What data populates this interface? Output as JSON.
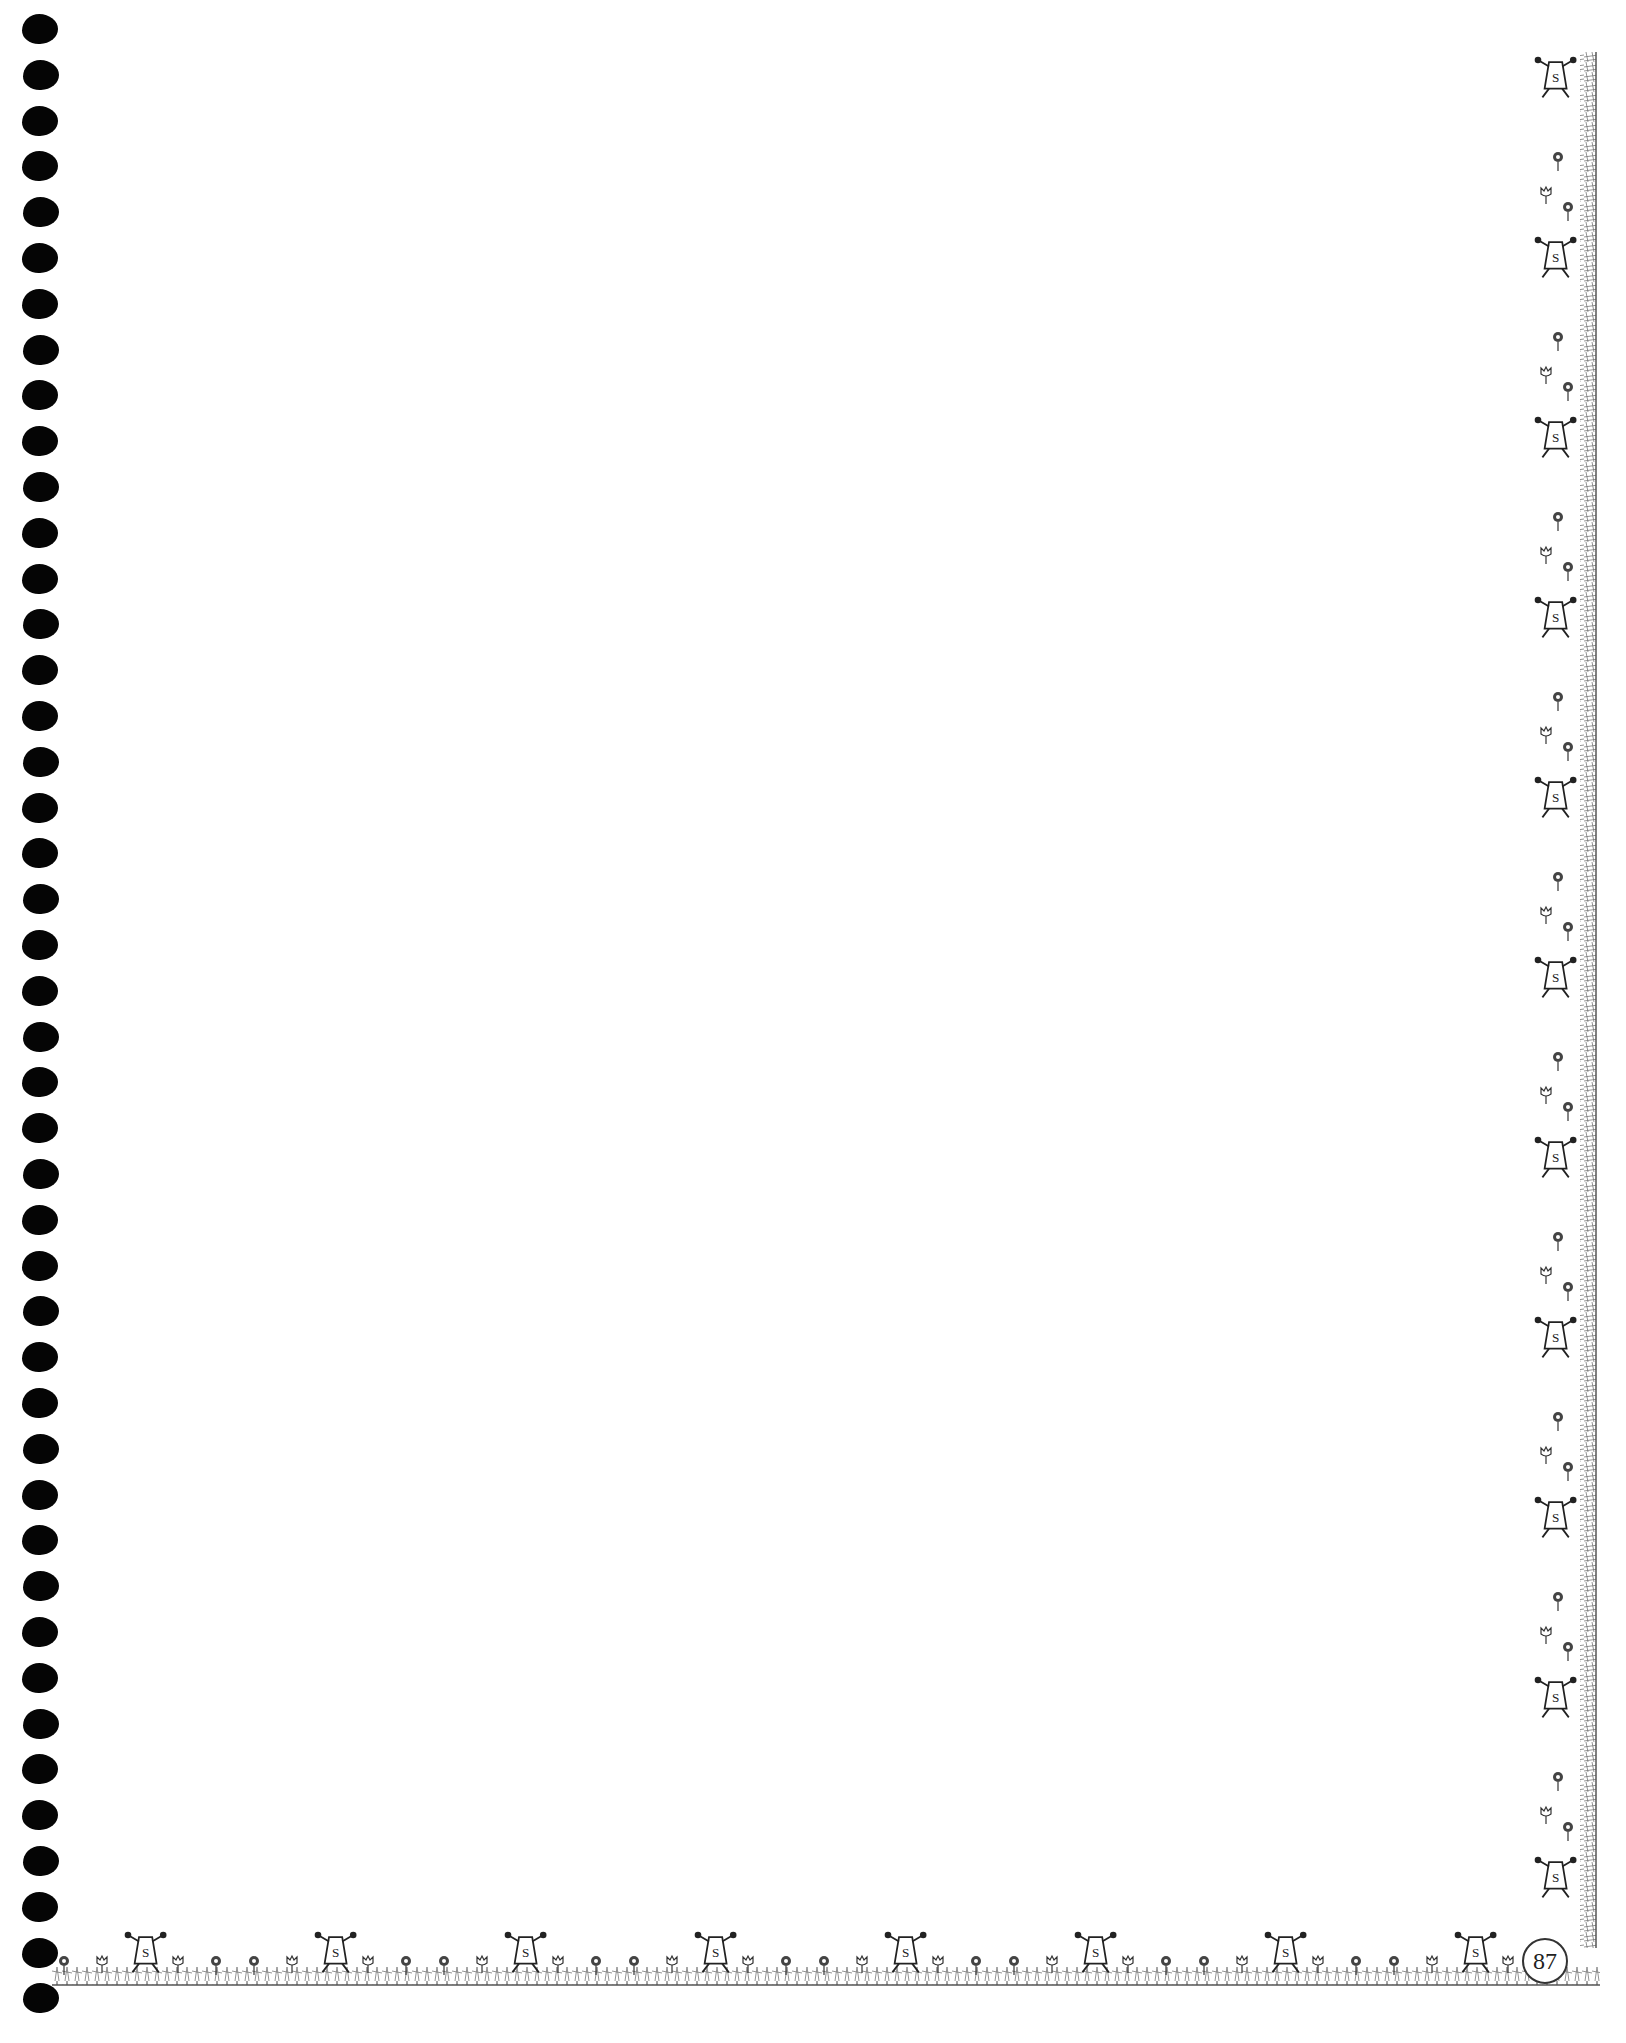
{
  "page": {
    "type": "blank notebook page with decorative border",
    "page_number": "87",
    "binding": {
      "style": "spiral punch holes",
      "hole_count": 44,
      "color": "#050505"
    },
    "border": {
      "sides": [
        "right",
        "bottom"
      ],
      "motif_icons": [
        "superhero-s-figure-icon",
        "flower-icon",
        "tulip-icon",
        "grass-icon"
      ],
      "color": "#333333"
    }
  }
}
